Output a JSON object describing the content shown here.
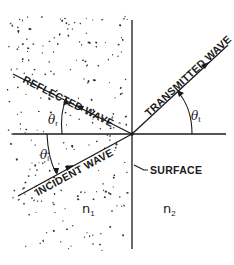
{
  "diagram": {
    "title": "",
    "labels": {
      "reflected_wave": "REFLECTED WAVE",
      "transmitted_wave": "TRANSMITTED WAVE",
      "incident_wave": "INCIDENT WAVE",
      "surface": "SURFACE",
      "medium_1": "n",
      "medium_1_sub": "1",
      "medium_2": "n",
      "medium_2_sub": "2",
      "theta_r": "θ",
      "theta_r_sub": "r",
      "theta_i": "θ",
      "theta_i_sub": "i",
      "theta_t": "θ",
      "theta_t_sub": "t"
    },
    "regions": [
      {
        "name": "medium-1",
        "index_label": "n1",
        "pattern": "stippled",
        "side": "left"
      },
      {
        "name": "medium-2",
        "index_label": "n2",
        "pattern": "blank",
        "side": "right"
      }
    ],
    "colors": {
      "ink": "#1a1a1a",
      "background": "#ffffff"
    }
  }
}
